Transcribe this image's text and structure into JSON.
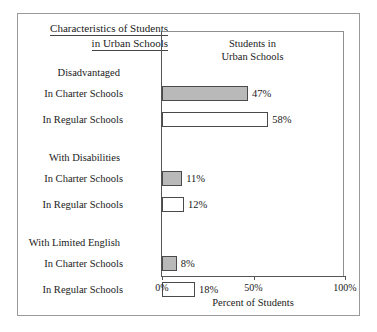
{
  "caption": {
    "line1": "Characteristics of Students",
    "line2": "in Urban Schools"
  },
  "chart_data": {
    "type": "bar",
    "orientation": "horizontal",
    "title": "Students in\nUrban Schools",
    "title_line1": "Students in",
    "title_line2": "Urban Schools",
    "xlabel": "Percent of Students",
    "ylabel": "",
    "xlim": [
      0,
      100
    ],
    "xticks": [
      0,
      50,
      100
    ],
    "xticklabels": [
      "0%",
      "50%",
      "100%"
    ],
    "grid": false,
    "legend": "none",
    "value_suffix": "%",
    "colors": {
      "charter_fill": "#b9b9b9",
      "regular_fill": "#ffffff",
      "bar_outline": "#4a4a4a",
      "axis": "#555555",
      "frame": "#9a9a9a"
    },
    "series": [
      {
        "name": "In Charter Schools",
        "values": [
          47,
          11,
          8
        ]
      },
      {
        "name": "In Regular Schools",
        "values": [
          58,
          12,
          18
        ]
      }
    ],
    "categories": [
      "Disadvantaged",
      "With Disabilities",
      "With Limited English"
    ],
    "groups": [
      {
        "header": "Disadvantaged",
        "rows": [
          {
            "label": "In Charter Schools",
            "value": 47,
            "value_label": "47%",
            "type": "charter"
          },
          {
            "label": "In Regular Schools",
            "value": 58,
            "value_label": "58%",
            "type": "regular"
          }
        ]
      },
      {
        "header": "With Disabilities",
        "rows": [
          {
            "label": "In Charter Schools",
            "value": 11,
            "value_label": "11%",
            "type": "charter"
          },
          {
            "label": "In Regular Schools",
            "value": 12,
            "value_label": "12%",
            "type": "regular"
          }
        ]
      },
      {
        "header": "With Limited English",
        "rows": [
          {
            "label": "In Charter Schools",
            "value": 8,
            "value_label": "8%",
            "type": "charter"
          },
          {
            "label": "In Regular Schools",
            "value": 18,
            "value_label": "18%",
            "type": "regular"
          }
        ]
      }
    ]
  }
}
